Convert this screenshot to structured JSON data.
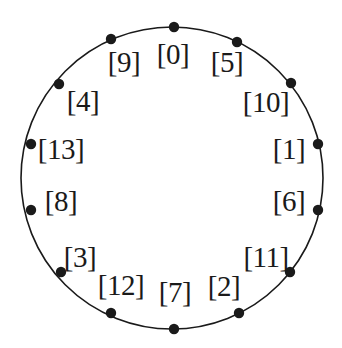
{
  "figure": {
    "background_color": "#ffffff",
    "stroke_color": "#1a1a1a",
    "dot_color": "#1a1a1a",
    "circle": {
      "center_x": 172,
      "center_y": 178,
      "radius": 151,
      "stroke_width": 1.6
    },
    "dot_radius": 5.2,
    "node_count": 14
  },
  "chart_data": {
    "type": "scatter",
    "title": "",
    "xlabel": "",
    "ylabel": "",
    "grid": false,
    "legend": null,
    "nodes": [
      {
        "label": "[0]",
        "index": 0,
        "angle_deg": 90,
        "dot_x": 174,
        "dot_y": 27,
        "text_x": 173,
        "text_y": 54
      },
      {
        "label": "[5]",
        "index": 5,
        "angle_deg": 64.286,
        "dot_x": 237,
        "dot_y": 42,
        "text_x": 227,
        "text_y": 62
      },
      {
        "label": "[10]",
        "index": 10,
        "angle_deg": 38.571,
        "dot_x": 291,
        "dot_y": 83,
        "text_x": 266,
        "text_y": 102
      },
      {
        "label": "[1]",
        "index": 1,
        "angle_deg": 12.857,
        "dot_x": 318,
        "dot_y": 144,
        "text_x": 289,
        "text_y": 149
      },
      {
        "label": "[6]",
        "index": 6,
        "angle_deg": -12.857,
        "dot_x": 318,
        "dot_y": 210,
        "text_x": 289,
        "text_y": 201
      },
      {
        "label": "[11]",
        "index": 11,
        "angle_deg": -38.571,
        "dot_x": 290,
        "dot_y": 272,
        "text_x": 266,
        "text_y": 257
      },
      {
        "label": "[2]",
        "index": 2,
        "angle_deg": -64.286,
        "dot_x": 239,
        "dot_y": 313,
        "text_x": 224,
        "text_y": 286
      },
      {
        "label": "[7]",
        "index": 7,
        "angle_deg": -90,
        "dot_x": 174,
        "dot_y": 329,
        "text_x": 175,
        "text_y": 292
      },
      {
        "label": "[12]",
        "index": 12,
        "angle_deg": -115.714,
        "dot_x": 111,
        "dot_y": 313,
        "text_x": 121,
        "text_y": 285
      },
      {
        "label": "[3]",
        "index": 3,
        "angle_deg": -141.429,
        "dot_x": 61,
        "dot_y": 272,
        "text_x": 80,
        "text_y": 257
      },
      {
        "label": "[8]",
        "index": 8,
        "angle_deg": -167.143,
        "dot_x": 31,
        "dot_y": 210,
        "text_x": 61,
        "text_y": 201
      },
      {
        "label": "[13]",
        "index": 13,
        "angle_deg": 167.143,
        "dot_x": 31,
        "dot_y": 144,
        "text_x": 61,
        "text_y": 149
      },
      {
        "label": "[4]",
        "index": 4,
        "angle_deg": 141.429,
        "dot_x": 59,
        "dot_y": 84,
        "text_x": 83,
        "text_y": 101
      },
      {
        "label": "[9]",
        "index": 9,
        "angle_deg": 115.714,
        "dot_x": 111,
        "dot_y": 39,
        "text_x": 124,
        "text_y": 62
      }
    ]
  }
}
